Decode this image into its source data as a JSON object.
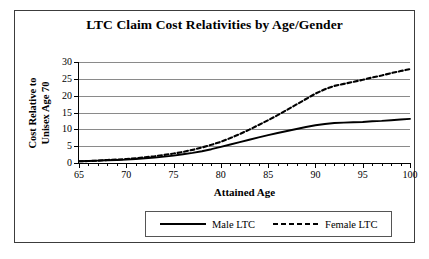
{
  "chart_data": {
    "type": "line",
    "title": "LTC Claim Cost Relativities by Age/Gender",
    "xlabel": "Attained Age",
    "ylabel": "Cost Relative to\nUnisex Age 70",
    "ylabel_line1": "Cost Relative to",
    "ylabel_line2": "Unisex Age 70",
    "xlim": [
      65,
      100
    ],
    "ylim": [
      0,
      30
    ],
    "grid": true,
    "legend_position": "bottom",
    "x_major_ticks": [
      65,
      70,
      75,
      80,
      85,
      90,
      95,
      100
    ],
    "x_tick_labels": [
      "65",
      "70",
      "75",
      "80",
      "85",
      "90",
      "95",
      "100"
    ],
    "y_ticks": [
      0,
      5,
      10,
      15,
      20,
      25,
      30
    ],
    "y_tick_labels": [
      "0",
      "5",
      "10",
      "15",
      "20",
      "25",
      "30"
    ],
    "x": [
      65,
      66,
      67,
      68,
      69,
      70,
      71,
      72,
      73,
      74,
      75,
      76,
      77,
      78,
      79,
      80,
      81,
      82,
      83,
      84,
      85,
      86,
      87,
      88,
      89,
      90,
      91,
      92,
      93,
      94,
      95,
      96,
      97,
      98,
      99,
      100
    ],
    "series": [
      {
        "name": "Male LTC",
        "style": "solid",
        "color": "#000000",
        "values": [
          0.5,
          0.6,
          0.7,
          0.8,
          0.9,
          1.0,
          1.2,
          1.4,
          1.6,
          1.9,
          2.2,
          2.6,
          3.0,
          3.5,
          4.1,
          4.8,
          5.5,
          6.2,
          6.9,
          7.6,
          8.3,
          8.9,
          9.5,
          10.1,
          10.7,
          11.2,
          11.6,
          11.9,
          12.0,
          12.1,
          12.2,
          12.4,
          12.5,
          12.7,
          12.9,
          13.1
        ]
      },
      {
        "name": "Female LTC",
        "style": "dashed",
        "color": "#000000",
        "values": [
          0.5,
          0.6,
          0.7,
          0.9,
          1.0,
          1.2,
          1.4,
          1.7,
          2.0,
          2.4,
          2.8,
          3.3,
          3.9,
          4.6,
          5.4,
          6.3,
          7.4,
          8.6,
          9.9,
          11.3,
          12.7,
          14.2,
          15.8,
          17.4,
          19.0,
          20.6,
          21.9,
          22.9,
          23.5,
          24.1,
          24.7,
          25.4,
          26.0,
          26.7,
          27.3,
          27.9
        ]
      }
    ]
  },
  "legend": {
    "entries": [
      {
        "label": "Male LTC"
      },
      {
        "label": "Female LTC"
      }
    ]
  }
}
